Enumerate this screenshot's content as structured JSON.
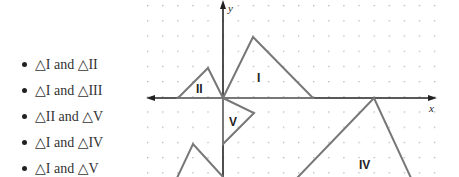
{
  "options": [
    {
      "label": "△I and △II"
    },
    {
      "label": "△I and △III"
    },
    {
      "label": "△II and △V"
    },
    {
      "label": "△I and △IV"
    },
    {
      "label": "△I and △V"
    }
  ],
  "graph": {
    "x_axis_label": "x",
    "y_axis_label": "y",
    "triangles": [
      {
        "name": "I",
        "vertices": [
          [
            0,
            0
          ],
          [
            2,
            4
          ],
          [
            6,
            0
          ]
        ]
      },
      {
        "name": "II",
        "vertices": [
          [
            -3,
            0
          ],
          [
            -1,
            2
          ],
          [
            0,
            0
          ]
        ]
      },
      {
        "name": "III",
        "vertices": [
          [
            -2,
            -3
          ],
          [
            0,
            -5
          ]
        ],
        "partial": true
      },
      {
        "name": "IV",
        "vertices": [
          [
            10,
            0
          ],
          [
            5,
            -5
          ],
          [
            12.5,
            -5
          ]
        ],
        "partial": true
      },
      {
        "name": "V",
        "vertices": [
          [
            0,
            0
          ],
          [
            2,
            -1
          ],
          [
            0,
            -3
          ]
        ]
      }
    ],
    "labels": {
      "I": "I",
      "II": "II",
      "IV": "IV",
      "V": "V"
    },
    "colors": {
      "triangle_stroke": "#777777",
      "axis": "#222222",
      "grid_dot": "#b5b5b5"
    }
  }
}
